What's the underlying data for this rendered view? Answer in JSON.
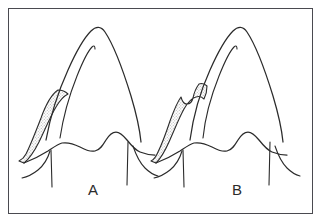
{
  "figure": {
    "kind": "line-art-diagram",
    "background_color": "#ffffff",
    "frame": {
      "visible": true,
      "border_color": "#4a4a50",
      "border_width_px": 1.6,
      "x": 8,
      "y": 8,
      "width": 305,
      "height": 206
    },
    "stroke_color": "#2b2b2b",
    "shade_fill_color": "#d9d9d9",
    "shade_pattern": "stipple-dots",
    "panels": [
      {
        "id": "A",
        "label": "A",
        "label_x": 93,
        "label_y": 195,
        "description": "tooth cusp with smooth elongated shaded gingival flap on the left side",
        "flap_contour": "smooth",
        "origin_x": 0
      },
      {
        "id": "B",
        "label": "B",
        "label_x": 237,
        "label_y": 195,
        "description": "tooth cusp with notched stepped shaded gingival flap on the left side",
        "flap_contour": "notched",
        "origin_x": 144
      }
    ]
  }
}
